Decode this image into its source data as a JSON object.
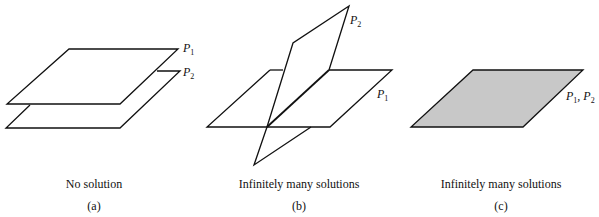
{
  "panels": [
    {
      "id": "a",
      "caption": "No solution",
      "tag": "(a)",
      "labels": [
        {
          "base": "P",
          "sub": "1"
        },
        {
          "base": "P",
          "sub": "2"
        }
      ],
      "description": "Two parallel planes"
    },
    {
      "id": "b",
      "caption": "Infinitely many solutions",
      "tag": "(b)",
      "labels": [
        {
          "base": "P",
          "sub": "2"
        },
        {
          "base": "P",
          "sub": "1"
        }
      ],
      "description": "Two planes intersecting in a line"
    },
    {
      "id": "c",
      "caption": "Infinitely many solutions",
      "tag": "(c)",
      "labels": [
        {
          "base": "P",
          "sub": "1"
        },
        {
          "base": "P",
          "sub": "2"
        }
      ],
      "description": "Two coincident planes",
      "fill_color": "#c8c8c8"
    }
  ],
  "colors": {
    "stroke": "#111111",
    "fill": "#c8c8c8",
    "background": "#ffffff"
  }
}
